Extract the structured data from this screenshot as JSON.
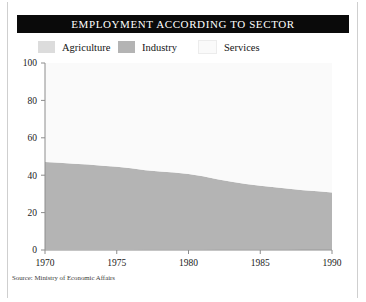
{
  "figure": {
    "title": "EMPLOYMENT ACCORDING TO SECTOR",
    "source_note": "Source: Ministry of Economic Affairs"
  },
  "colors": {
    "title_bar_background": "#0a0a0a",
    "title_bar_text": "#ffffff",
    "plot_background": "#f0f0f0",
    "agriculture": "#dcdcdc",
    "industry": "#b4b4b4",
    "services": "#fafafa",
    "axis": "#8c8c8c",
    "frame_rule": "#cfcfcf"
  },
  "chart_data": {
    "type": "area",
    "stacked": true,
    "title": "EMPLOYMENT ACCORDING TO SECTOR",
    "xlabel": "",
    "ylabel": "",
    "xlim": [
      1970,
      1990
    ],
    "ylim": [
      0,
      100
    ],
    "grid": false,
    "legend_position": "above-plot",
    "xticks": [
      1970,
      1975,
      1980,
      1985,
      1990
    ],
    "yticks": [
      0,
      20,
      40,
      60,
      80,
      100
    ],
    "x": [
      1970,
      1971,
      1972,
      1973,
      1974,
      1975,
      1976,
      1977,
      1978,
      1979,
      1980,
      1981,
      1982,
      1983,
      1984,
      1985,
      1986,
      1987,
      1988,
      1989,
      1990
    ],
    "series": [
      {
        "name": "Agriculture",
        "color": "#dcdcdc",
        "values": [
          0.6,
          0.6,
          0.5,
          0.5,
          0.5,
          0.5,
          0.5,
          0.4,
          0.4,
          0.4,
          0.4,
          0.4,
          0.3,
          0.3,
          0.3,
          0.3,
          0.3,
          0.3,
          0.2,
          0.2,
          0.2
        ]
      },
      {
        "name": "Industry",
        "color": "#b4b4b4",
        "values": [
          46.4,
          46.0,
          45.6,
          45.2,
          44.6,
          44.0,
          43.2,
          42.3,
          41.6,
          41.0,
          40.2,
          39.0,
          37.6,
          36.2,
          35.0,
          34.0,
          33.2,
          32.5,
          31.8,
          31.2,
          30.6
        ]
      },
      {
        "name": "Services",
        "color": "#fafafa",
        "values": [
          53.0,
          53.4,
          53.9,
          54.3,
          54.9,
          55.5,
          56.3,
          57.3,
          58.0,
          58.6,
          59.4,
          60.6,
          62.1,
          63.5,
          64.7,
          65.7,
          66.5,
          67.2,
          68.0,
          68.6,
          69.2
        ]
      }
    ]
  }
}
